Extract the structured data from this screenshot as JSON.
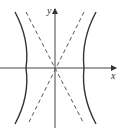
{
  "diagram": {
    "type": "hyperbola",
    "axes": {
      "x_label": "x",
      "y_label": "y"
    },
    "colors": {
      "curve": "#333333",
      "axis": "#444444",
      "asymptote": "#555555",
      "background": "#ffffff"
    },
    "elements": [
      {
        "name": "left-branch",
        "style": "solid"
      },
      {
        "name": "right-branch",
        "style": "solid"
      },
      {
        "name": "asymptote-positive-slope",
        "style": "dashed"
      },
      {
        "name": "asymptote-negative-slope",
        "style": "dashed"
      }
    ]
  }
}
